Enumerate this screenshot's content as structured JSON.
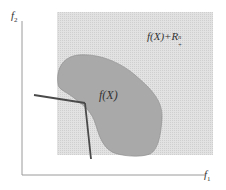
{
  "diagram": {
    "axes": {
      "x_label": "f",
      "x_sub": "1",
      "y_label": "f",
      "y_sub": "2"
    },
    "regions": {
      "dominated_label": "f(X)+R",
      "dominated_sup": "n",
      "dominated_sub": "+",
      "image_label": "f(X)"
    },
    "colors": {
      "shaded": "#d8d8d8",
      "blob": "#a9a9a9",
      "axis": "#9a9a9a",
      "lines": "#4a4a4a"
    }
  }
}
